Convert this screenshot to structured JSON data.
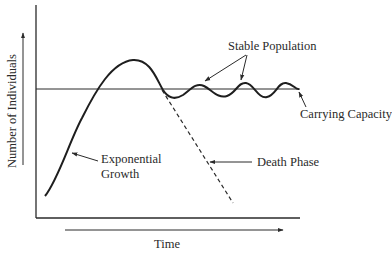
{
  "diagram": {
    "type": "population-growth-curve",
    "axes": {
      "x_label": "Time",
      "y_label": "Number of Individuals"
    },
    "annotations": {
      "stable_population": "Stable Population",
      "carrying_capacity": "Carrying Capacity",
      "exponential_growth_line1": "Exponential",
      "exponential_growth_line2": "Growth",
      "death_phase": "Death Phase"
    },
    "colors": {
      "ink": "#2a2a2a",
      "background": "#ffffff"
    }
  }
}
